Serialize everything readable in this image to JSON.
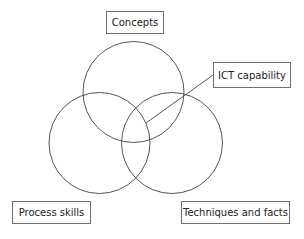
{
  "diagram": {
    "type": "venn",
    "line_color": "#555555",
    "circles": [
      {
        "name": "Concepts",
        "cx": 133.5,
        "cy": 92,
        "r": 50
      },
      {
        "name": "Process skills",
        "cx": 99.5,
        "cy": 143,
        "r": 50
      },
      {
        "name": "Techniques and facts",
        "cx": 172,
        "cy": 143,
        "r": 50
      }
    ],
    "labels": {
      "concepts": "Concepts",
      "ict": "ICT capability",
      "process": "Process skills",
      "techniques": "Techniques and facts"
    },
    "leader_line": {
      "from": "ICT capability",
      "to": "center intersection"
    }
  }
}
